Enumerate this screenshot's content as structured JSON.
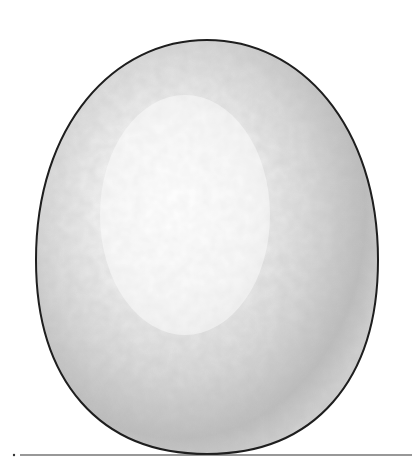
{
  "illustration": {
    "subject": "egg",
    "colors": {
      "background": "#ffffff",
      "outline": "#1e1e1e",
      "highlight": "#fbfbfb",
      "midtone": "#dcdcdc",
      "shadow": "#a9a9a9",
      "ground_line": "#333333"
    }
  }
}
